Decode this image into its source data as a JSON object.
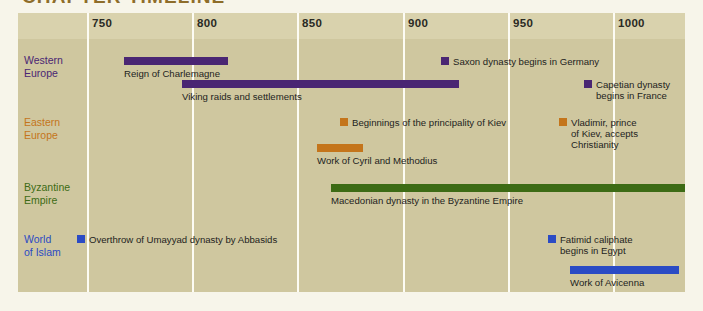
{
  "chapter_title": "CHAPTER TIMELINE",
  "colors": {
    "page_background": "#f7f5ea",
    "chart_background": "#cfc79f",
    "header_band": "#d9d2ad",
    "gridline": "#fdfcf4",
    "title": "#8e6d2a",
    "western_europe": "#4a2673",
    "eastern_europe": "#c4751b",
    "byzantine_empire": "#3d6b15",
    "world_of_islam": "#2b4bc4",
    "caption_text": "#23231d"
  },
  "chart_data": {
    "type": "bar",
    "title": "CHAPTER TIMELINE",
    "xlabel": "",
    "ylabel": "",
    "xlim": [
      725,
      1015
    ],
    "grid": true,
    "legend": "none",
    "axis_ticks": [
      750,
      800,
      850,
      900,
      950,
      1000
    ],
    "axis_tick_labels": [
      "750",
      "800",
      "850",
      "900",
      "950",
      "1000"
    ],
    "categories": [
      "Western Europe",
      "Eastern Europe",
      "Byzantine Empire",
      "World of Islam"
    ],
    "series": [
      {
        "name": "Western Europe",
        "color": "#4a2673",
        "events": [
          {
            "label": "Reign of Charlemagne",
            "kind": "span",
            "start": 768,
            "end": 818
          },
          {
            "label": "Viking raids and settlements",
            "kind": "span",
            "start": 793,
            "end": 925
          },
          {
            "label": "Saxon dynasty begins in Germany",
            "kind": "point",
            "start": 919,
            "end": 919
          },
          {
            "label": "Capetian dynasty\nbegins in France",
            "kind": "point",
            "start": 987,
            "end": 987
          }
        ]
      },
      {
        "name": "Eastern Europe",
        "color": "#c4751b",
        "events": [
          {
            "label": "Beginnings of the principality of Kiev",
            "kind": "point",
            "start": 862,
            "end": 862
          },
          {
            "label": "Work of Cyril and Methodius",
            "kind": "span",
            "start": 863,
            "end": 885
          },
          {
            "label": "Vladimir, prince\nof Kiev, accepts\nChristianity",
            "kind": "point",
            "start": 988,
            "end": 988
          }
        ]
      },
      {
        "name": "Byzantine Empire",
        "color": "#3d6b15",
        "events": [
          {
            "label": "Macedonian dynasty in the Byzantine Empire",
            "kind": "span",
            "start": 867,
            "end": 1036
          }
        ]
      },
      {
        "name": "World of Islam",
        "color": "#2b4bc4",
        "events": [
          {
            "label": "Overthrow of Umayyad dynasty by Abbasids",
            "kind": "point",
            "start": 750,
            "end": 750
          },
          {
            "label": "Fatimid caliphate\nbegins in Egypt",
            "kind": "point",
            "start": 969,
            "end": 969
          },
          {
            "label": "Work of Avicenna",
            "kind": "span",
            "start": 980,
            "end": 1032
          }
        ]
      }
    ]
  },
  "axis": {
    "ticks": [
      {
        "label": "750",
        "x": 87
      },
      {
        "label": "800",
        "x": 192
      },
      {
        "label": "850",
        "x": 297
      },
      {
        "label": "900",
        "x": 403
      },
      {
        "label": "950",
        "x": 508
      },
      {
        "label": "1000",
        "x": 613
      }
    ]
  },
  "rows": [
    {
      "id": "western-europe",
      "name_line1": "Western",
      "name_line2": "Europe",
      "color": "#4a2673",
      "label_top": 54,
      "items": [
        {
          "id": "reign-of-charlemagne",
          "kind": "span",
          "label": "Reign of Charlemagne",
          "bar_x": 124,
          "bar_y": 57,
          "bar_w": 104,
          "cap_x": 124,
          "cap_y": 68
        },
        {
          "id": "viking-raids",
          "kind": "span",
          "label": "Viking raids and settlements",
          "bar_x": 182,
          "bar_y": 80,
          "bar_w": 277,
          "cap_x": 182,
          "cap_y": 91
        },
        {
          "id": "saxon-dynasty",
          "kind": "point",
          "label": "Saxon dynasty begins in Germany",
          "bar_x": 441,
          "bar_y": 57,
          "bar_w": 8,
          "cap_x": 453,
          "cap_y": 56
        },
        {
          "id": "capetian-dynasty",
          "kind": "point",
          "label": "Capetian dynasty\nbegins in France",
          "bar_x": 584,
          "bar_y": 80,
          "bar_w": 8,
          "cap_x": 596,
          "cap_y": 79
        }
      ]
    },
    {
      "id": "eastern-europe",
      "name_line1": "Eastern",
      "name_line2": "Europe",
      "color": "#c4751b",
      "label_top": 116,
      "items": [
        {
          "id": "principality-of-kiev",
          "kind": "point",
          "label": "Beginnings of the principality of Kiev",
          "bar_x": 340,
          "bar_y": 118,
          "bar_w": 8,
          "cap_x": 352,
          "cap_y": 117
        },
        {
          "id": "cyril-and-methodius",
          "kind": "span",
          "label": "Work of Cyril and Methodius",
          "bar_x": 317,
          "bar_y": 144,
          "bar_w": 46,
          "cap_x": 317,
          "cap_y": 155
        },
        {
          "id": "vladimir-christianity",
          "kind": "point",
          "label": "Vladimir, prince\nof Kiev, accepts\nChristianity",
          "bar_x": 559,
          "bar_y": 118,
          "bar_w": 8,
          "cap_x": 571,
          "cap_y": 117
        }
      ]
    },
    {
      "id": "byzantine-empire",
      "name_line1": "Byzantine",
      "name_line2": "Empire",
      "color": "#3d6b15",
      "label_top": 181,
      "items": [
        {
          "id": "macedonian-dynasty",
          "kind": "span",
          "label": "Macedonian dynasty in the Byzantine Empire",
          "bar_x": 331,
          "bar_y": 184,
          "bar_w": 354,
          "cap_x": 331,
          "cap_y": 195
        }
      ]
    },
    {
      "id": "world-of-islam",
      "name_line1": "World",
      "name_line2": "of Islam",
      "color": "#2b4bc4",
      "label_top": 233,
      "items": [
        {
          "id": "overthrow-umayyad",
          "kind": "point",
          "label": "Overthrow of Umayyad dynasty by Abbasids",
          "bar_x": 77,
          "bar_y": 235,
          "bar_w": 8,
          "cap_x": 89,
          "cap_y": 234
        },
        {
          "id": "fatimid-caliphate",
          "kind": "point",
          "label": "Fatimid caliphate\nbegins in Egypt",
          "bar_x": 548,
          "bar_y": 235,
          "bar_w": 8,
          "cap_x": 560,
          "cap_y": 234
        },
        {
          "id": "work-of-avicenna",
          "kind": "span",
          "label": "Work of Avicenna",
          "bar_x": 570,
          "bar_y": 266,
          "bar_w": 109,
          "cap_x": 570,
          "cap_y": 277
        }
      ]
    }
  ]
}
